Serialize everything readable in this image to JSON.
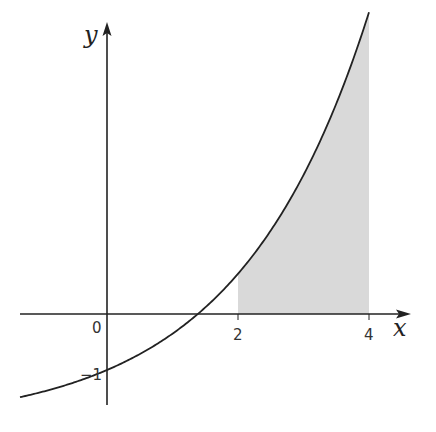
{
  "chart_data": {
    "type": "line",
    "title": "",
    "xlabel": "x",
    "ylabel": "y",
    "function": "y = e^(x/2) - 2 (approx. shape)",
    "x_ticks": [
      "0",
      "2",
      "4"
    ],
    "y_ticks": [
      "-1"
    ],
    "y_intercept": -1,
    "x_intercept_approx": 1.39,
    "shaded_region": {
      "from_x": 2,
      "to_x": 4,
      "between": "curve and x-axis",
      "color": "#d9d9d9"
    },
    "curve_color": "#222222",
    "axis_color": "#222222"
  },
  "labels": {
    "x_axis": "x",
    "y_axis": "y",
    "origin": "0",
    "tick_2": "2",
    "tick_4": "4",
    "tick_neg1": "−1"
  }
}
